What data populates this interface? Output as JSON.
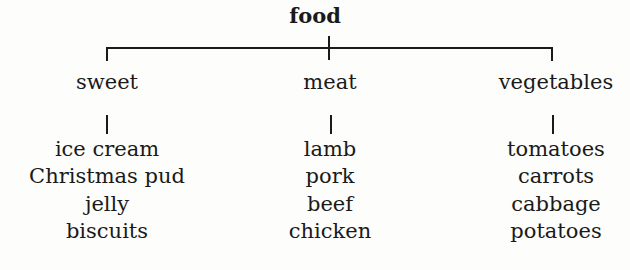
{
  "diagram": {
    "type": "tree",
    "root": "food",
    "categories": [
      {
        "label": "sweet",
        "items": [
          "ice cream",
          "Christmas pud",
          "jelly",
          "biscuits"
        ]
      },
      {
        "label": "meat",
        "items": [
          "lamb",
          "pork",
          "beef",
          "chicken"
        ]
      },
      {
        "label": "vegetables",
        "items": [
          "tomatoes",
          "carrots",
          "cabbage",
          "potatoes"
        ]
      }
    ]
  }
}
